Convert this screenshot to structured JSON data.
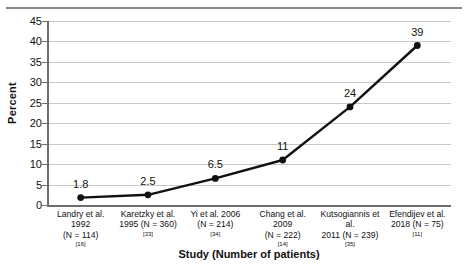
{
  "chart_data": {
    "type": "line",
    "title": "",
    "xlabel": "Study (Number of patients)",
    "ylabel": "Percent",
    "ylim": [
      0,
      45
    ],
    "ytick_step": 5,
    "yticks": [
      0,
      5,
      10,
      15,
      20,
      25,
      30,
      35,
      40,
      45
    ],
    "grid": true,
    "legend": false,
    "marker": "filled-circle",
    "line_color": "#111111",
    "grid_color": "#c9c9c9",
    "axis_color": "#6e6e6e",
    "categories": [
      "Landry et al. 1992 (N = 114)",
      "Karetzky et al. 1995 (N = 360)",
      "Yi et al. 2006 (N = 214)",
      "Chang et al. 2009 (N = 222)",
      "Kutsogiannis et al. 2011 (N = 239)",
      "Efendijev et al. 2018 (N = 75)"
    ],
    "values": [
      1.8,
      2.5,
      6.5,
      11,
      24,
      39
    ],
    "data_labels": [
      "1.8",
      "2.5",
      "6.5",
      "11",
      "24",
      "39"
    ],
    "points": [
      {
        "line1": "Landry et al. 1992",
        "line2": "(N = 114)",
        "ref": "[16]",
        "label": "1.8",
        "value": 1.8
      },
      {
        "line1": "Karetzky et al.",
        "line2": "1995 (N = 360)",
        "ref": "[33]",
        "label": "2.5",
        "value": 2.5
      },
      {
        "line1": "Yi et al. 2006",
        "line2": "(N = 214)",
        "ref": "[34]",
        "label": "6.5",
        "value": 6.5
      },
      {
        "line1": "Chang et al. 2009",
        "line2": "(N = 222)",
        "ref": "[14]",
        "label": "11",
        "value": 11
      },
      {
        "line1": "Kutsogiannis et al.",
        "line2": "2011 (N = 239)",
        "ref": "[35]",
        "label": "24",
        "value": 24
      },
      {
        "line1": "Efendijev et al.",
        "line2": "2018 (N = 75)",
        "ref": "[11]",
        "label": "39",
        "value": 39
      }
    ]
  },
  "axes": {
    "y_title": "Percent",
    "x_title": "Study (Number of patients)",
    "y_labels": [
      "45",
      "40",
      "35",
      "30",
      "25",
      "20",
      "15",
      "10",
      "5",
      "0"
    ]
  }
}
